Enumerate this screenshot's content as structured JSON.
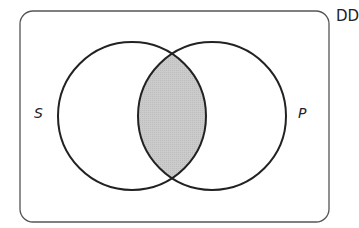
{
  "diagram": {
    "type": "venn",
    "corner_text": "DD",
    "universe": {
      "shape": "rounded-rectangle"
    },
    "sets": [
      {
        "label": "S",
        "position": "left"
      },
      {
        "label": "P",
        "position": "right"
      }
    ],
    "shaded_region": "S ∩ P",
    "colors": {
      "stroke": "#222222",
      "universe_stroke": "#555555",
      "shade": "#c8c8c8",
      "background": "#ffffff"
    }
  }
}
